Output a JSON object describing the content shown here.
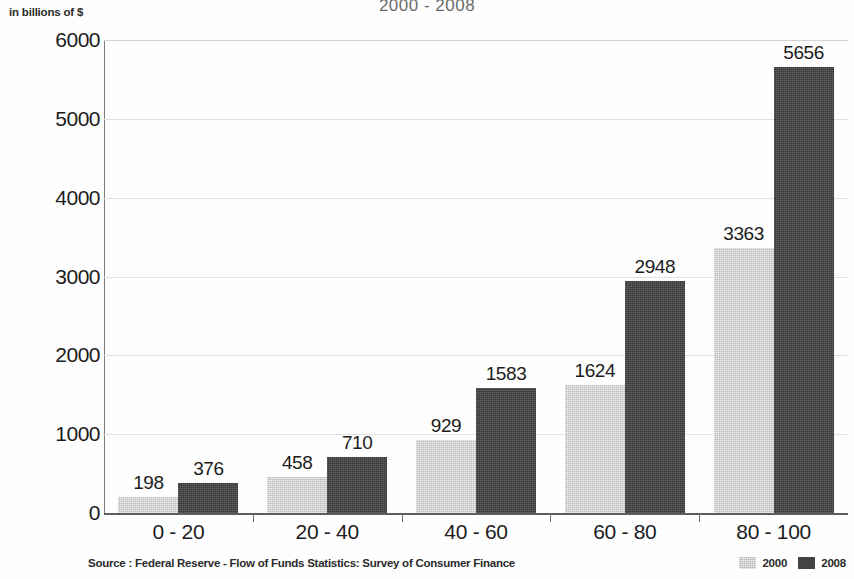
{
  "chart_data": {
    "type": "bar",
    "title": "2000 - 2008",
    "ylabel": "in billions of $",
    "xlabel": "",
    "categories": [
      "0 - 20",
      "20 - 40",
      "40 - 60",
      "60 - 80",
      "80 - 100"
    ],
    "series": [
      {
        "name": "2000",
        "color": "#cbcbcb",
        "values": [
          198,
          458,
          929,
          1624,
          3363
        ]
      },
      {
        "name": "2008",
        "color": "#434343",
        "values": [
          376,
          710,
          1583,
          2948,
          5656
        ]
      }
    ],
    "ylim": [
      0,
      6000
    ],
    "yticks": [
      0,
      1000,
      2000,
      3000,
      4000,
      5000,
      6000
    ],
    "ytick_labels": [
      "0",
      "1000",
      "2000",
      "3000",
      "4000",
      "5000",
      "6000"
    ],
    "grid": true,
    "grid_axis": "y",
    "legend_position": "bottom-right",
    "data_labels": true,
    "source": "Source : Federal Reserve - Flow of Funds Statistics: Survey of Consumer Finance"
  }
}
